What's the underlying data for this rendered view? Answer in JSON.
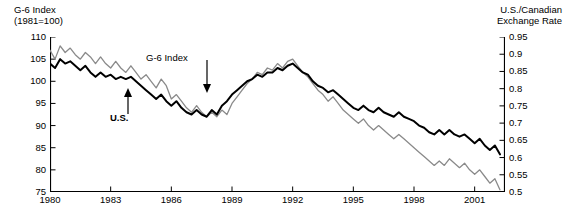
{
  "chart_data": {
    "type": "line",
    "title": "",
    "xlabel": "",
    "ylabel": "G-6 Index (1981=100)",
    "y2label": "U.S./Canadian Exchange Rate",
    "grid": false,
    "legend": "annotations-on-plot",
    "xlim": [
      1980,
      2002.5
    ],
    "ylim": [
      75,
      110
    ],
    "y2lim": [
      0.5,
      0.95
    ],
    "xticks": [
      1980,
      1983,
      1986,
      1989,
      1992,
      1995,
      1998,
      2001
    ],
    "yticks": [
      75,
      80,
      85,
      90,
      95,
      100,
      105,
      110
    ],
    "y2ticks": [
      "0.5",
      "0.55",
      "0.6",
      "0.65",
      "0.7",
      "0.75",
      "0.8",
      "0.85",
      "0.9",
      "0.95"
    ],
    "series": [
      {
        "name": "G-6 Index",
        "color": "#8a8a8a",
        "axis": "left",
        "x": [
          1980.0,
          1980.25,
          1980.5,
          1980.75,
          1981.0,
          1981.25,
          1981.5,
          1981.75,
          1982.0,
          1982.25,
          1982.5,
          1982.75,
          1983.0,
          1983.25,
          1983.5,
          1983.75,
          1984.0,
          1984.25,
          1984.5,
          1984.75,
          1985.0,
          1985.25,
          1985.5,
          1985.75,
          1986.0,
          1986.25,
          1986.5,
          1986.75,
          1987.0,
          1987.25,
          1987.5,
          1987.75,
          1988.0,
          1988.25,
          1988.5,
          1988.75,
          1989.0,
          1989.25,
          1989.5,
          1989.75,
          1990.0,
          1990.25,
          1990.5,
          1990.75,
          1991.0,
          1991.25,
          1991.5,
          1991.75,
          1992.0,
          1992.25,
          1992.5,
          1992.75,
          1993.0,
          1993.25,
          1993.5,
          1993.75,
          1994.0,
          1994.25,
          1994.5,
          1994.75,
          1995.0,
          1995.25,
          1995.5,
          1995.75,
          1996.0,
          1996.25,
          1996.5,
          1996.75,
          1997.0,
          1997.25,
          1997.5,
          1997.75,
          1998.0,
          1998.25,
          1998.5,
          1998.75,
          1999.0,
          1999.25,
          1999.5,
          1999.75,
          2000.0,
          2000.25,
          2000.5,
          2000.75,
          2001.0,
          2001.25,
          2001.5,
          2001.75,
          2002.0,
          2002.25
        ],
        "values": [
          107.0,
          105.0,
          108.0,
          106.5,
          107.5,
          106.0,
          105.0,
          106.5,
          105.5,
          104.0,
          105.5,
          104.0,
          103.0,
          104.5,
          103.0,
          102.0,
          103.5,
          102.0,
          100.5,
          101.5,
          100.0,
          98.5,
          100.5,
          99.0,
          96.0,
          97.0,
          95.5,
          94.0,
          93.0,
          94.5,
          93.0,
          92.0,
          93.0,
          92.0,
          93.5,
          92.5,
          95.0,
          96.5,
          98.0,
          99.5,
          100.5,
          102.0,
          101.5,
          103.0,
          102.5,
          104.0,
          103.0,
          104.5,
          105.0,
          103.5,
          102.0,
          101.0,
          99.5,
          98.0,
          97.0,
          95.5,
          96.5,
          95.0,
          93.5,
          92.5,
          91.5,
          90.5,
          91.5,
          90.0,
          89.0,
          90.0,
          89.0,
          88.0,
          87.0,
          88.0,
          87.0,
          86.0,
          85.0,
          84.0,
          83.0,
          82.0,
          81.0,
          82.0,
          81.0,
          82.5,
          81.5,
          80.5,
          81.5,
          80.0,
          79.0,
          80.0,
          78.5,
          77.0,
          78.0,
          75.5
        ]
      },
      {
        "name": "U.S.",
        "color": "#000000",
        "axis": "left",
        "x": [
          1980.0,
          1980.25,
          1980.5,
          1980.75,
          1981.0,
          1981.25,
          1981.5,
          1981.75,
          1982.0,
          1982.25,
          1982.5,
          1982.75,
          1983.0,
          1983.25,
          1983.5,
          1983.75,
          1984.0,
          1984.25,
          1984.5,
          1984.75,
          1985.0,
          1985.25,
          1985.5,
          1985.75,
          1986.0,
          1986.25,
          1986.5,
          1986.75,
          1987.0,
          1987.25,
          1987.5,
          1987.75,
          1988.0,
          1988.25,
          1988.5,
          1988.75,
          1989.0,
          1989.25,
          1989.5,
          1989.75,
          1990.0,
          1990.25,
          1990.5,
          1990.75,
          1991.0,
          1991.25,
          1991.5,
          1991.75,
          1992.0,
          1992.25,
          1992.5,
          1992.75,
          1993.0,
          1993.25,
          1993.5,
          1993.75,
          1994.0,
          1994.25,
          1994.5,
          1994.75,
          1995.0,
          1995.25,
          1995.5,
          1995.75,
          1996.0,
          1996.25,
          1996.5,
          1996.75,
          1997.0,
          1997.25,
          1997.5,
          1997.75,
          1998.0,
          1998.25,
          1998.5,
          1998.75,
          1999.0,
          1999.25,
          1999.5,
          1999.75,
          2000.0,
          2000.25,
          2000.5,
          2000.75,
          2001.0,
          2001.25,
          2001.5,
          2001.75,
          2002.0,
          2002.25
        ],
        "values": [
          104.0,
          103.0,
          105.0,
          104.0,
          104.5,
          103.5,
          102.5,
          103.5,
          102.0,
          101.0,
          102.0,
          101.0,
          101.5,
          100.5,
          101.0,
          100.5,
          101.0,
          100.0,
          99.0,
          98.0,
          97.0,
          96.0,
          97.0,
          95.5,
          94.5,
          95.5,
          94.0,
          93.0,
          92.5,
          93.5,
          92.5,
          92.0,
          93.5,
          92.5,
          94.5,
          95.5,
          97.0,
          98.0,
          99.0,
          100.0,
          100.5,
          101.5,
          101.0,
          102.0,
          102.0,
          103.0,
          102.5,
          103.5,
          104.0,
          103.0,
          102.0,
          101.5,
          100.0,
          99.0,
          98.5,
          97.5,
          98.0,
          97.0,
          96.0,
          95.0,
          94.0,
          93.5,
          94.5,
          93.5,
          93.0,
          94.0,
          93.0,
          92.5,
          92.0,
          93.0,
          92.0,
          91.5,
          91.0,
          90.0,
          89.5,
          88.5,
          88.0,
          89.0,
          88.0,
          89.0,
          88.0,
          87.5,
          88.0,
          87.0,
          86.0,
          87.0,
          85.5,
          84.5,
          85.5,
          83.5
        ]
      }
    ],
    "annotations": [
      {
        "text": "G-6 Index",
        "points_to": "G-6 Index"
      },
      {
        "text": "U.S.",
        "points_to": "U.S."
      }
    ]
  },
  "axes": {
    "left_title": "G-6 Index\n(1981=100)",
    "right_title": "U.S./Canadian\nExchange Rate",
    "left_ticks": [
      "110",
      "105",
      "100",
      "95",
      "90",
      "85",
      "80",
      "75"
    ],
    "right_ticks": [
      "0.95",
      "0.9",
      "0.85",
      "0.8",
      "0.75",
      "0.7",
      "0.65",
      "0.6",
      "0.55",
      "0.5"
    ],
    "x_ticks": [
      "1980",
      "1983",
      "1986",
      "1989",
      "1992",
      "1995",
      "1998",
      "2001"
    ]
  },
  "annotations": {
    "g6_label": "G-6 Index",
    "us_label": "U.S."
  },
  "colors": {
    "g6_line": "#8a8a8a",
    "us_line": "#000000",
    "axis": "#000000",
    "background": "#ffffff"
  },
  "caption": ""
}
